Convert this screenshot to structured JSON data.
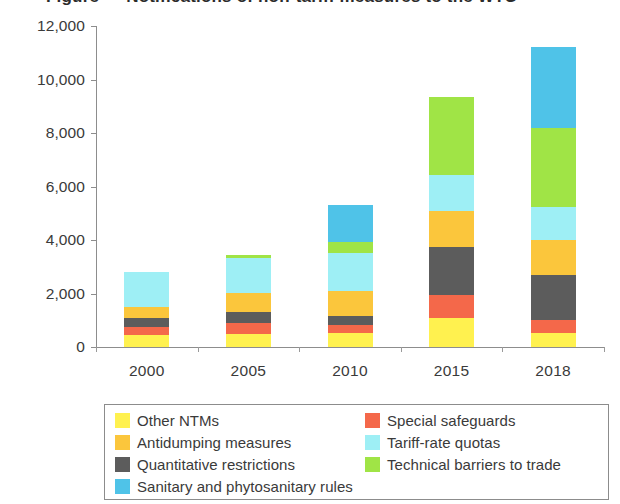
{
  "title": "Figure — Notifications of non-tariff measures to the WTO",
  "chart_data": {
    "type": "bar",
    "subtype": "stacked",
    "title": "",
    "xlabel": "",
    "ylabel": "",
    "categories": [
      "2000",
      "2005",
      "2010",
      "2015",
      "2018"
    ],
    "ylim": [
      0,
      12000
    ],
    "yticks": [
      0,
      2000,
      4000,
      6000,
      8000,
      10000,
      12000
    ],
    "ytick_labels": [
      "0",
      "2,000",
      "4,000",
      "6,000",
      "8,000",
      "10,000",
      "12,000"
    ],
    "grid": false,
    "legend_position": "bottom",
    "series": [
      {
        "name": "Other NTMs",
        "color": "#FFF14F",
        "values": [
          460,
          500,
          520,
          1100,
          520
        ]
      },
      {
        "name": "Special safeguards",
        "color": "#F4684A",
        "values": [
          290,
          380,
          300,
          850,
          490
        ]
      },
      {
        "name": "Quantitative restrictions",
        "color": "#5C5C5C",
        "values": [
          330,
          420,
          330,
          1790,
          1680
        ]
      },
      {
        "name": "Antidumping measures",
        "color": "#FBC63C",
        "values": [
          410,
          710,
          930,
          1350,
          1310
        ]
      },
      {
        "name": "Tariff-rate quotas",
        "color": "#9EEFF5",
        "values": [
          1310,
          1330,
          1430,
          1350,
          1240
        ]
      },
      {
        "name": "Technical barriers to trade",
        "color": "#A0E446",
        "values": [
          0,
          110,
          410,
          2920,
          2950
        ]
      },
      {
        "name": "Sanitary and phytosanitary rules",
        "color": "#4FC3E8",
        "values": [
          0,
          0,
          1390,
          0,
          3010
        ]
      }
    ],
    "totals": [
      2800,
      3450,
      5710,
      9360,
      11200
    ]
  },
  "legend": {
    "items": [
      {
        "label": "Other NTMs",
        "color": "#FFF14F"
      },
      {
        "label": "Special safeguards",
        "color": "#F4684A"
      },
      {
        "label": "Antidumping measures",
        "color": "#FBC63C"
      },
      {
        "label": "Tariff-rate quotas",
        "color": "#9EEFF5"
      },
      {
        "label": "Quantitative restrictions",
        "color": "#5C5C5C"
      },
      {
        "label": "Technical barriers to trade",
        "color": "#A0E446"
      },
      {
        "label": "Sanitary and phytosanitary rules",
        "color": "#4FC3E8"
      }
    ]
  }
}
